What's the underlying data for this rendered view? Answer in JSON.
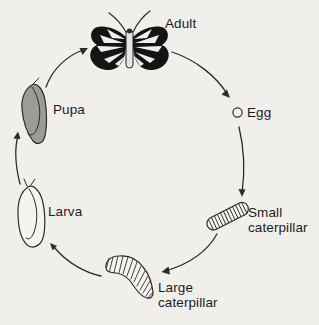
{
  "colors": {
    "background": "#f1efec",
    "line": "#2e2c2a",
    "text": "#1c1c1c",
    "pupa_fill": "#9c9b98",
    "butterfly_wing_fill": "#141414",
    "shape_fill": "#f6f4f1"
  },
  "stages": {
    "adult": {
      "label": "Adult"
    },
    "egg": {
      "label": "Egg"
    },
    "small_caterpillar": {
      "label_line1": "Small",
      "label_line2": "caterpillar"
    },
    "large_caterpillar": {
      "label_line1": "Large",
      "label_line2": "caterpillar"
    },
    "larva": {
      "label": "Larva"
    },
    "pupa": {
      "label": "Pupa"
    }
  },
  "cycle_sequence": [
    "Adult",
    "Egg",
    "Small caterpillar",
    "Large caterpillar",
    "Larva",
    "Pupa"
  ]
}
